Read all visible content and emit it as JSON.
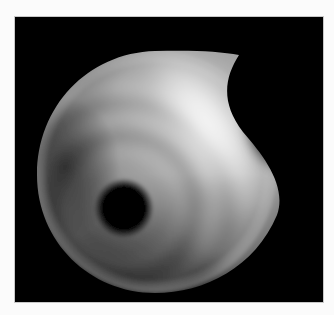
{
  "image": {
    "description": "Grayscale rendered disk with concave notch and dark hole",
    "colors": {
      "background": "#fbfbfb",
      "frame": "#000000",
      "highlight": "#ffffff",
      "midtone": "#8a8a8a",
      "shadow": "#2a2a2a",
      "hole": "#000000"
    }
  }
}
